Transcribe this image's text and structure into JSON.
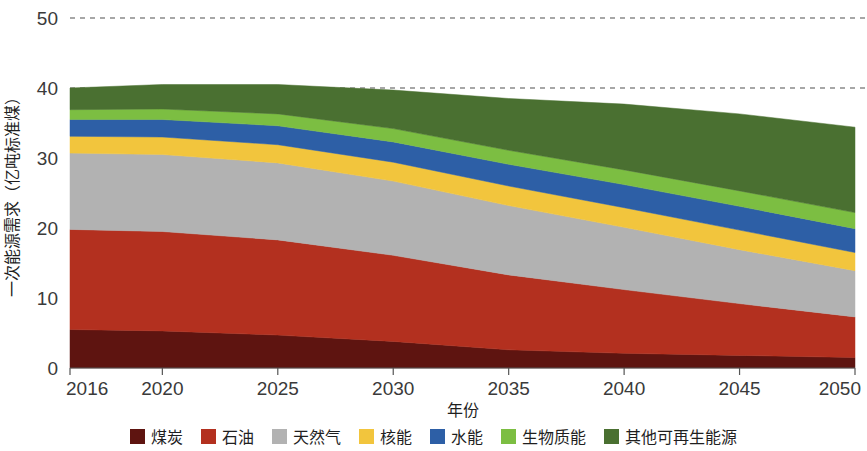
{
  "chart_data": {
    "type": "area",
    "stacked": true,
    "title": "",
    "xlabel": "年份",
    "ylabel": "一次能源需求（亿吨标准煤）",
    "x": [
      2016,
      2020,
      2025,
      2030,
      2035,
      2040,
      2045,
      2050
    ],
    "x_tick_labels": [
      "2016",
      "2020",
      "2025",
      "2030",
      "2035",
      "2040",
      "2045",
      "2050"
    ],
    "xlim": [
      2016,
      2050
    ],
    "ylim": [
      0,
      50
    ],
    "y_tick_labels": [
      "0",
      "10",
      "20",
      "30",
      "40",
      "50"
    ],
    "y_ticks": [
      0,
      10,
      20,
      30,
      40,
      50
    ],
    "gridlines": [
      40,
      50
    ],
    "grid": "dashed-horizontal",
    "legend_position": "bottom",
    "series": [
      {
        "name": "煤炭",
        "color": "#5E1410",
        "values": [
          5.5,
          5.3,
          4.7,
          3.8,
          2.6,
          2.1,
          1.8,
          1.5
        ]
      },
      {
        "name": "石油",
        "color": "#B3301F",
        "values": [
          14.3,
          14.2,
          13.6,
          12.3,
          10.7,
          9.1,
          7.4,
          5.8
        ]
      },
      {
        "name": "天然气",
        "color": "#B2B2B2",
        "values": [
          10.9,
          11.0,
          11.0,
          10.6,
          9.9,
          8.9,
          7.7,
          6.6
        ]
      },
      {
        "name": "核能",
        "color": "#F2C53D",
        "values": [
          2.4,
          2.5,
          2.6,
          2.7,
          2.8,
          2.8,
          2.8,
          2.6
        ]
      },
      {
        "name": "水能",
        "color": "#2D5FA6",
        "values": [
          2.4,
          2.5,
          2.7,
          2.9,
          3.1,
          3.3,
          3.4,
          3.4
        ]
      },
      {
        "name": "生物质能",
        "color": "#7CBE42",
        "values": [
          1.4,
          1.5,
          1.7,
          1.9,
          2.0,
          2.1,
          2.2,
          2.3
        ]
      },
      {
        "name": "其他可再生能源",
        "color": "#4A7031",
        "values": [
          3.1,
          3.5,
          4.2,
          5.5,
          7.4,
          9.4,
          11.0,
          12.2
        ]
      }
    ]
  },
  "axes": {
    "y_title": "一次能源需求（亿吨标准煤）",
    "x_title": "年份"
  },
  "legend": {
    "items": [
      {
        "label": "煤炭",
        "color": "#5E1410"
      },
      {
        "label": "石油",
        "color": "#B3301F"
      },
      {
        "label": "天然气",
        "color": "#B2B2B2"
      },
      {
        "label": "核能",
        "color": "#F2C53D"
      },
      {
        "label": "水能",
        "color": "#2D5FA6"
      },
      {
        "label": "生物质能",
        "color": "#7CBE42"
      },
      {
        "label": "其他可再生能源",
        "color": "#4A7031"
      }
    ]
  }
}
